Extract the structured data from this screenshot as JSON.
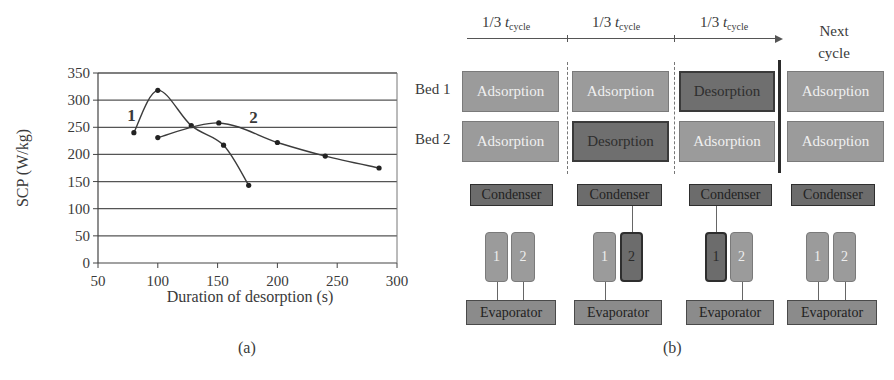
{
  "chart_data": {
    "type": "line",
    "title": "",
    "xlabel": "Duration of desorption (s)",
    "ylabel": "SCP (W/kg)",
    "xlim": [
      50,
      300
    ],
    "ylim": [
      0,
      350
    ],
    "x_ticks": [
      50,
      100,
      150,
      200,
      250,
      300
    ],
    "y_ticks": [
      0,
      50,
      100,
      150,
      200,
      250,
      300,
      350
    ],
    "grid": "horizontal",
    "legend": "none",
    "series": [
      {
        "name": "1",
        "x": [
          80,
          100,
          128,
          155,
          176
        ],
        "y": [
          240,
          318,
          253,
          217,
          143
        ]
      },
      {
        "name": "2",
        "x": [
          100,
          151,
          200,
          240,
          285
        ],
        "y": [
          231,
          258,
          222,
          197,
          175
        ]
      }
    ],
    "annotations": [
      {
        "text": "1",
        "near_series": "1",
        "at": [
          78,
          262
        ]
      },
      {
        "text": "2",
        "near_series": "2",
        "at": [
          180,
          258
        ]
      }
    ],
    "caption": "(a)"
  },
  "diagram": {
    "caption": "(b)",
    "timeline": {
      "phases": [
        {
          "prefix": "1/3 ",
          "var": "t",
          "sub": "cycle"
        },
        {
          "prefix": "1/3 ",
          "var": "t",
          "sub": "cycle"
        },
        {
          "prefix": "1/3 ",
          "var": "t",
          "sub": "cycle"
        }
      ],
      "next_cycle_line1": "Next",
      "next_cycle_line2": "cycle"
    },
    "beds": {
      "labels": [
        "Bed 1",
        "Bed 2"
      ],
      "columns": [
        {
          "bed1": "Adsorption",
          "bed2": "Adsorption"
        },
        {
          "bed1": "Adsorption",
          "bed2": "Desorption"
        },
        {
          "bed1": "Desorption",
          "bed2": "Adsorption"
        },
        {
          "bed1": "Adsorption",
          "bed2": "Adsorption"
        }
      ]
    },
    "circuit": {
      "condenser_label": "Condenser",
      "evaporator_label": "Evaporator",
      "bed_numbers": [
        "1",
        "2"
      ],
      "columns": [
        {
          "connected_to_condenser": "none",
          "connected_to_evaporator": [
            "1",
            "2"
          ]
        },
        {
          "connected_to_condenser": "2",
          "connected_to_evaporator": [
            "1"
          ]
        },
        {
          "connected_to_condenser": "1",
          "connected_to_evaporator": [
            "2"
          ]
        },
        {
          "connected_to_condenser": "none",
          "connected_to_evaporator": [
            "1",
            "2"
          ]
        }
      ]
    }
  }
}
